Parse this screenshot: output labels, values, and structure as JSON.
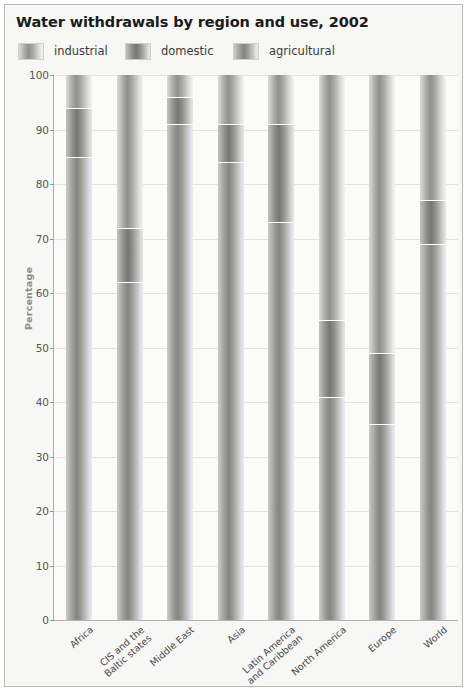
{
  "chart_data": {
    "type": "bar",
    "subtype": "stacked-percentage-column",
    "title": "Water withdrawals by region and use, 2002",
    "xlabel": "",
    "ylabel": "Percentage",
    "ylim": [
      0,
      100
    ],
    "ytick_step": 10,
    "grid": true,
    "legend_position": "top",
    "stack_order_bottom_to_top": [
      "agricultural",
      "domestic",
      "industrial"
    ],
    "categories": [
      "Africa",
      "CIS and the\nBaltic states",
      "Middle East",
      "Asia",
      "Latin America\nand Caribbean",
      "North America",
      "Europe",
      "World"
    ],
    "yticks": [
      "0",
      "10",
      "20",
      "30",
      "40",
      "50",
      "60",
      "70",
      "80",
      "90",
      "100"
    ],
    "series": [
      {
        "name": "agricultural",
        "values": [
          85,
          62,
          91,
          84,
          73,
          41,
          36,
          69
        ]
      },
      {
        "name": "domestic",
        "values": [
          9,
          10,
          5,
          7,
          18,
          14,
          13,
          8
        ]
      },
      {
        "name": "industrial",
        "values": [
          6,
          28,
          4,
          9,
          9,
          45,
          51,
          23
        ]
      }
    ],
    "boundaries_percent": {
      "Africa": [
        85,
        94
      ],
      "CIS and the Baltic states": [
        62,
        72
      ],
      "Middle East": [
        91,
        96
      ],
      "Asia": [
        84,
        91
      ],
      "Latin America and Caribbean": [
        73,
        91
      ],
      "North America": [
        41,
        55
      ],
      "Europe": [
        36,
        49
      ],
      "World": [
        69,
        77
      ]
    }
  },
  "legend": {
    "items": [
      {
        "label": "industrial",
        "swatch": "gradient-light-gray",
        "key": "industrial"
      },
      {
        "label": "domestic",
        "swatch": "gradient-dark-gray",
        "key": "domestic"
      },
      {
        "label": "agricultural",
        "swatch": "gradient-medium-gray",
        "key": "agricultural"
      }
    ]
  },
  "colors": {
    "card_background": "#f7f7f5",
    "card_border": "#b8b8b4",
    "plot_background": "#fbfbfa",
    "gridline": "#e2e2de",
    "axis_line": "#b0b0ac",
    "title_text": "#1b1b1b",
    "tick_text": "#555553",
    "axis_title_text": "#8b8b88",
    "segment_divider": "#ffffff"
  }
}
